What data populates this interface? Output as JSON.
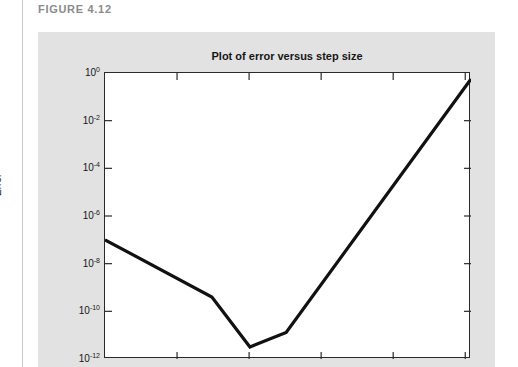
{
  "figure": {
    "label": "FIGURE 4.12"
  },
  "chart_data": {
    "type": "line",
    "title": "Plot of error versus step size",
    "xlabel": "",
    "ylabel": "Error",
    "yscale": "log",
    "xscale": "log",
    "ylim": [
      1e-12,
      1
    ],
    "ytick_labels": [
      "10",
      "10",
      "10",
      "10",
      "10",
      "10",
      "10"
    ],
    "ytick_exponents": [
      "0",
      "-2",
      "-4",
      "-6",
      "-8",
      "-10",
      "-12"
    ],
    "ytick_values": [
      1,
      0.01,
      0.0001,
      1e-06,
      1e-08,
      1e-10,
      1e-12
    ],
    "xtick_labels": [
      "",
      "",
      "",
      "",
      "",
      ""
    ],
    "grid": false,
    "legend": false,
    "series": [
      {
        "name": "error",
        "x": [
          0,
          0.292,
          0.396,
          0.495,
          1.0
        ],
        "y": [
          1e-07,
          4e-10,
          3.2e-12,
          1.3e-11,
          0.56
        ]
      }
    ],
    "annotations": []
  },
  "colors": {
    "panel": "#e2e2e2",
    "plot_background": "#ffffff",
    "line": "#111111",
    "axis": "#2a2a2a",
    "figure_label": "#8b8b8b",
    "text": "#161616"
  }
}
